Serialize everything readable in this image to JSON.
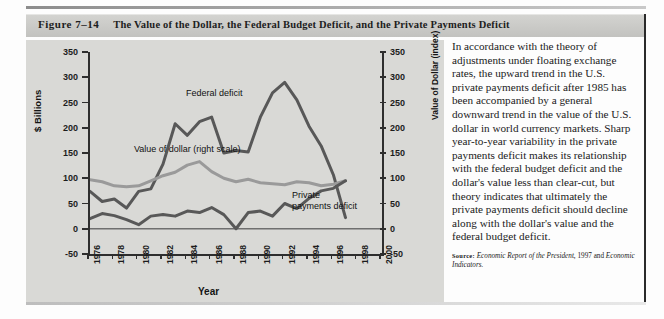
{
  "figure": {
    "number": "Figure 7–14",
    "title": "The Value of the Dollar, the Federal Budget Deficit, and the Private Payments Deficit"
  },
  "chart_data": {
    "type": "line",
    "title": "",
    "xlabel": "Year",
    "ylabel": "$ Billions",
    "y2label": "Value of Dollar (index)",
    "xlim": [
      1976,
      2000
    ],
    "ylim": [
      -50,
      350
    ],
    "y2lim": [
      -50,
      350
    ],
    "yticks": [
      350,
      300,
      250,
      200,
      150,
      100,
      50,
      0,
      -50
    ],
    "y2ticks": [
      350,
      300,
      250,
      200,
      150,
      100,
      50,
      0,
      -50
    ],
    "xticks": [
      1976,
      1978,
      1980,
      1982,
      1984,
      1986,
      1988,
      1990,
      1992,
      1994,
      1996,
      1998,
      2000
    ],
    "grid": false,
    "legend_position": "inline-annotations",
    "x": [
      1976,
      1977,
      1978,
      1979,
      1980,
      1981,
      1982,
      1983,
      1984,
      1985,
      1986,
      1987,
      1988,
      1989,
      1990,
      1991,
      1992,
      1993,
      1994,
      1995,
      1996,
      1997
    ],
    "series": [
      {
        "name": "Federal deficit",
        "color": "#585858",
        "label_text": "Federal deficit",
        "values": [
          74,
          54,
          59,
          41,
          74,
          79,
          128,
          208,
          185,
          212,
          221,
          150,
          155,
          152,
          221,
          269,
          290,
          255,
          203,
          164,
          107,
          22
        ]
      },
      {
        "name": "Value of dollar (right scale)",
        "color": "#9a9a9a",
        "label_text": "Value of dollar (right scale)",
        "values": [
          97,
          93,
          85,
          83,
          85,
          95,
          105,
          112,
          126,
          133,
          113,
          100,
          93,
          98,
          91,
          89,
          87,
          93,
          91,
          85,
          88,
          95
        ]
      },
      {
        "name": "Private payments deficit",
        "color": "#585858",
        "label_text": "Private payments deficit",
        "values": [
          20,
          30,
          26,
          18,
          8,
          25,
          28,
          25,
          35,
          32,
          42,
          28,
          0,
          32,
          35,
          25,
          50,
          40,
          60,
          75,
          80,
          95
        ]
      }
    ]
  },
  "sidebar_text": {
    "paragraph": "In accordance with the theory of adjustments under floating exchange rates, the upward trend in the U.S. private payments deficit after 1985 has been accompanied by a general downward trend in the value of the U.S. dollar in world currency markets. Sharp year-to-year variability in the private payments deficit makes its relationship with the federal budget deficit and the dollar's value less than clear-cut, but theory indicates that ultimately the private payments deficit should decline along with the dollar's value and the federal budget deficit.",
    "source_label": "Source:",
    "source_italic_1": "Economic Report of the President,",
    "source_plain": " 1997 and ",
    "source_italic_2": "Economic Indicators."
  }
}
